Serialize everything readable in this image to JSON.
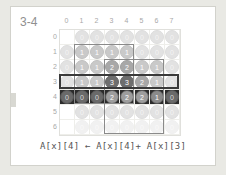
{
  "slide": {
    "title": "3-4",
    "caption": "A[x][4] ← A[x][4]+ A[x][3]"
  },
  "colors": {
    "background": "#e9e9e4",
    "slide_background": "#ffffff",
    "title_color": "#8f8f8f",
    "caption_color": "#555555",
    "highlight_row_background": "#2b2b2b",
    "box_border": "#8a8a8a",
    "row_box_border": "#3a3a3a"
  },
  "chart_data": {
    "type": "heatmap",
    "title": "3-4",
    "xlabel": "",
    "ylabel": "",
    "col_labels": [
      "0",
      "1",
      "2",
      "3",
      "4",
      "5",
      "6",
      "7"
    ],
    "row_labels": [
      "0",
      "1",
      "2",
      "3",
      "4",
      "5",
      "6"
    ],
    "grid": true,
    "legend": "none",
    "values": [
      [
        null,
        0,
        0,
        0,
        0,
        0,
        0,
        0
      ],
      [
        0,
        1,
        1,
        1,
        1,
        0,
        0,
        0
      ],
      [
        0,
        1,
        1,
        2,
        2,
        1,
        1,
        0
      ],
      [
        0,
        1,
        1,
        3,
        3,
        2,
        1,
        0
      ],
      [
        0,
        0,
        0,
        2,
        2,
        2,
        1,
        0
      ],
      [
        null,
        0,
        0,
        0,
        0,
        0,
        0,
        0
      ],
      [
        null,
        0,
        0,
        0,
        0,
        0,
        0,
        0
      ]
    ],
    "faded_rows": [
      6
    ],
    "highlighted_row": 4,
    "outlined_row": 3,
    "boxes": [
      {
        "name": "inner-box",
        "row_start": 1,
        "row_end": 4,
        "col_start": 1,
        "col_end": 4
      },
      {
        "name": "column-box",
        "row_start": 2,
        "row_end": 6,
        "col_start": 3,
        "col_end": 6
      }
    ]
  }
}
